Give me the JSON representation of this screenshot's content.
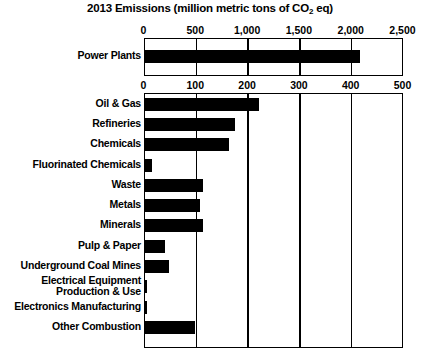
{
  "chart_data": {
    "type": "bar",
    "orientation": "horizontal",
    "title": "2013 Emissions (million metric tons of CO2 eq)",
    "title_prefix": "2013 Emissions (million metric tons of CO",
    "title_subscript": "2",
    "title_suffix": " eq)",
    "xlabel": "",
    "ylabel": "",
    "grid": true,
    "legend": null,
    "panels": [
      {
        "name": "power-plants-panel",
        "axis_position": "top",
        "xlim": [
          0,
          2500
        ],
        "ticks": [
          0,
          500,
          1000,
          1500,
          2000,
          2500
        ],
        "tick_labels": [
          "0",
          "500",
          "1,000",
          "1,500",
          "2,000",
          "2,500"
        ],
        "categories": [
          "Power Plants"
        ],
        "values": [
          2080
        ]
      },
      {
        "name": "sectors-panel",
        "axis_position": "top",
        "xlim": [
          0,
          500
        ],
        "ticks": [
          0,
          100,
          200,
          300,
          400,
          500
        ],
        "tick_labels": [
          "0",
          "100",
          "200",
          "300",
          "400",
          "500"
        ],
        "categories": [
          "Oil & Gas",
          "Refineries",
          "Chemicals",
          "Fluorinated Chemicals",
          "Waste",
          "Metals",
          "Minerals",
          "Pulp & Paper",
          "Underground Coal Mines",
          "Electrical Equipment\nProduction & Use",
          "Electronics Manufacturing",
          "Other Combustion"
        ],
        "values": [
          222,
          175,
          163,
          14,
          113,
          108,
          112,
          40,
          47,
          4,
          5,
          97
        ]
      }
    ],
    "colors": {
      "bar": "#000000",
      "axis": "#000000",
      "background": "#ffffff",
      "text": "#000000"
    }
  }
}
